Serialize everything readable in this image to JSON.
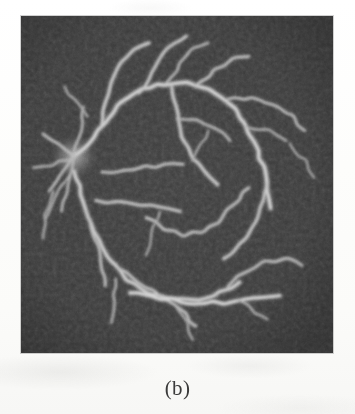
{
  "figure": {
    "caption": "(b)",
    "panel_label": "b",
    "image_kind": "retinal-vessel-segmentation",
    "background_color": "#3b3b3b",
    "vessel_color": "#c8c8c8",
    "page_color": "#fdfdfc",
    "panel": {
      "x": 21,
      "y": 16,
      "width": 312,
      "height": 337
    },
    "chart_data": {
      "type": "image",
      "title": "(b)",
      "description": "Grayscale retinal fundus vessel map: bright vessel tree on dark noisy background",
      "optic_disc": {
        "cx": 0.17,
        "cy": 0.42,
        "r": 0.055
      },
      "vessels": [
        {
          "name": "superior-temporal-arcade",
          "width": 3.2,
          "brightness": 0.82,
          "points": [
            [
              0.17,
              0.42
            ],
            [
              0.23,
              0.36
            ],
            [
              0.28,
              0.3
            ],
            [
              0.33,
              0.25
            ],
            [
              0.39,
              0.22
            ],
            [
              0.46,
              0.2
            ],
            [
              0.53,
              0.2
            ],
            [
              0.6,
              0.22
            ],
            [
              0.67,
              0.26
            ],
            [
              0.72,
              0.32
            ],
            [
              0.76,
              0.4
            ],
            [
              0.79,
              0.49
            ],
            [
              0.8,
              0.57
            ]
          ]
        },
        {
          "name": "superior-nasal-branch",
          "width": 2.6,
          "brightness": 0.78,
          "points": [
            [
              0.26,
              0.33
            ],
            [
              0.27,
              0.26
            ],
            [
              0.29,
              0.2
            ],
            [
              0.32,
              0.14
            ],
            [
              0.36,
              0.1
            ],
            [
              0.41,
              0.08
            ]
          ]
        },
        {
          "name": "superior-mid-branch",
          "width": 2.4,
          "brightness": 0.76,
          "points": [
            [
              0.38,
              0.23
            ],
            [
              0.42,
              0.17
            ],
            [
              0.45,
              0.12
            ],
            [
              0.49,
              0.08
            ],
            [
              0.53,
              0.06
            ]
          ]
        },
        {
          "name": "superior-upper-twig",
          "width": 1.8,
          "brightness": 0.7,
          "points": [
            [
              0.47,
              0.2
            ],
            [
              0.51,
              0.14
            ],
            [
              0.55,
              0.1
            ],
            [
              0.6,
              0.08
            ]
          ]
        },
        {
          "name": "superior-temporal-upper",
          "width": 2.2,
          "brightness": 0.74,
          "points": [
            [
              0.56,
              0.21
            ],
            [
              0.62,
              0.16
            ],
            [
              0.68,
              0.13
            ],
            [
              0.73,
              0.12
            ]
          ]
        },
        {
          "name": "temporal-lateral-branch",
          "width": 2.0,
          "brightness": 0.72,
          "points": [
            [
              0.66,
              0.25
            ],
            [
              0.74,
              0.24
            ],
            [
              0.81,
              0.26
            ],
            [
              0.87,
              0.3
            ],
            [
              0.91,
              0.34
            ]
          ]
        },
        {
          "name": "mid-temporal-short",
          "width": 1.7,
          "brightness": 0.66,
          "points": [
            [
              0.72,
              0.33
            ],
            [
              0.79,
              0.34
            ],
            [
              0.85,
              0.37
            ]
          ]
        },
        {
          "name": "central-descending",
          "width": 2.6,
          "brightness": 0.76,
          "points": [
            [
              0.48,
              0.21
            ],
            [
              0.5,
              0.29
            ],
            [
              0.52,
              0.36
            ],
            [
              0.55,
              0.42
            ],
            [
              0.59,
              0.46
            ],
            [
              0.63,
              0.5
            ]
          ]
        },
        {
          "name": "central-upper-hook",
          "width": 1.9,
          "brightness": 0.68,
          "points": [
            [
              0.5,
              0.3
            ],
            [
              0.56,
              0.31
            ],
            [
              0.62,
              0.33
            ],
            [
              0.67,
              0.37
            ]
          ]
        },
        {
          "name": "macular-branch",
          "width": 2.1,
          "brightness": 0.7,
          "points": [
            [
              0.26,
              0.46
            ],
            [
              0.33,
              0.46
            ],
            [
              0.4,
              0.45
            ],
            [
              0.46,
              0.44
            ],
            [
              0.52,
              0.44
            ]
          ]
        },
        {
          "name": "mid-horizontal",
          "width": 2.3,
          "brightness": 0.72,
          "points": [
            [
              0.24,
              0.55
            ],
            [
              0.31,
              0.55
            ],
            [
              0.38,
              0.56
            ],
            [
              0.45,
              0.57
            ],
            [
              0.51,
              0.58
            ]
          ]
        },
        {
          "name": "central-loop",
          "width": 2.2,
          "brightness": 0.71,
          "points": [
            [
              0.4,
              0.6
            ],
            [
              0.46,
              0.63
            ],
            [
              0.52,
              0.65
            ],
            [
              0.58,
              0.64
            ],
            [
              0.63,
              0.61
            ],
            [
              0.68,
              0.56
            ],
            [
              0.73,
              0.51
            ]
          ]
        },
        {
          "name": "temporal-descending",
          "width": 2.5,
          "brightness": 0.75,
          "points": [
            [
              0.79,
              0.5
            ],
            [
              0.77,
              0.57
            ],
            [
              0.74,
              0.63
            ],
            [
              0.7,
              0.68
            ],
            [
              0.65,
              0.72
            ]
          ]
        },
        {
          "name": "inferior-temporal-arcade",
          "width": 3.0,
          "brightness": 0.8,
          "points": [
            [
              0.17,
              0.46
            ],
            [
              0.2,
              0.55
            ],
            [
              0.23,
              0.64
            ],
            [
              0.28,
              0.72
            ],
            [
              0.34,
              0.78
            ],
            [
              0.41,
              0.82
            ],
            [
              0.49,
              0.84
            ],
            [
              0.57,
              0.84
            ],
            [
              0.64,
              0.82
            ],
            [
              0.7,
              0.79
            ]
          ]
        },
        {
          "name": "inferior-nasal-branch",
          "width": 2.2,
          "brightness": 0.72,
          "points": [
            [
              0.21,
              0.58
            ],
            [
              0.24,
              0.66
            ],
            [
              0.26,
              0.73
            ],
            [
              0.27,
              0.8
            ]
          ]
        },
        {
          "name": "inferior-mid-branch",
          "width": 2.3,
          "brightness": 0.73,
          "points": [
            [
              0.31,
              0.75
            ],
            [
              0.38,
              0.79
            ],
            [
              0.45,
              0.83
            ],
            [
              0.51,
              0.87
            ],
            [
              0.56,
              0.92
            ]
          ]
        },
        {
          "name": "inferior-long-horizontal",
          "width": 2.8,
          "brightness": 0.86,
          "points": [
            [
              0.35,
              0.82
            ],
            [
              0.45,
              0.84
            ],
            [
              0.55,
              0.85
            ],
            [
              0.65,
              0.85
            ],
            [
              0.75,
              0.84
            ],
            [
              0.83,
              0.83
            ]
          ]
        },
        {
          "name": "inferior-temporal-upper",
          "width": 2.2,
          "brightness": 0.72,
          "points": [
            [
              0.66,
              0.8
            ],
            [
              0.72,
              0.76
            ],
            [
              0.78,
              0.73
            ],
            [
              0.85,
              0.72
            ],
            [
              0.9,
              0.74
            ]
          ]
        },
        {
          "name": "inferior-temporal-twig",
          "width": 1.8,
          "brightness": 0.66,
          "points": [
            [
              0.7,
              0.84
            ],
            [
              0.75,
              0.88
            ],
            [
              0.79,
              0.9
            ]
          ]
        },
        {
          "name": "inferior-lower-twig",
          "width": 1.7,
          "brightness": 0.64,
          "points": [
            [
              0.5,
              0.86
            ],
            [
              0.53,
              0.91
            ],
            [
              0.55,
              0.96
            ]
          ]
        },
        {
          "name": "inferior-left-twig",
          "width": 1.8,
          "brightness": 0.65,
          "points": [
            [
              0.3,
              0.78
            ],
            [
              0.3,
              0.85
            ],
            [
              0.29,
              0.91
            ]
          ]
        },
        {
          "name": "disc-radial-1",
          "width": 2.0,
          "brightness": 0.74,
          "points": [
            [
              0.17,
              0.42
            ],
            [
              0.12,
              0.38
            ],
            [
              0.07,
              0.35
            ]
          ]
        },
        {
          "name": "disc-radial-2",
          "width": 1.9,
          "brightness": 0.72,
          "points": [
            [
              0.17,
              0.42
            ],
            [
              0.13,
              0.47
            ],
            [
              0.09,
              0.52
            ]
          ]
        },
        {
          "name": "disc-radial-3",
          "width": 1.8,
          "brightness": 0.7,
          "points": [
            [
              0.17,
              0.42
            ],
            [
              0.15,
              0.5
            ],
            [
              0.13,
              0.58
            ]
          ]
        },
        {
          "name": "disc-radial-4",
          "width": 1.8,
          "brightness": 0.7,
          "points": [
            [
              0.17,
              0.42
            ],
            [
              0.19,
              0.34
            ],
            [
              0.2,
              0.27
            ]
          ]
        },
        {
          "name": "disc-radial-5",
          "width": 1.7,
          "brightness": 0.68,
          "points": [
            [
              0.17,
              0.42
            ],
            [
              0.1,
              0.44
            ],
            [
              0.04,
              0.45
            ]
          ]
        },
        {
          "name": "disc-radial-6",
          "width": 1.6,
          "brightness": 0.66,
          "points": [
            [
              0.16,
              0.46
            ],
            [
              0.11,
              0.53
            ],
            [
              0.08,
              0.6
            ]
          ]
        },
        {
          "name": "nasal-lower-twig",
          "width": 1.6,
          "brightness": 0.64,
          "points": [
            [
              0.1,
              0.52
            ],
            [
              0.08,
              0.59
            ],
            [
              0.07,
              0.66
            ]
          ]
        },
        {
          "name": "superior-left-twig",
          "width": 1.6,
          "brightness": 0.64,
          "points": [
            [
              0.21,
              0.3
            ],
            [
              0.17,
              0.25
            ],
            [
              0.14,
              0.21
            ]
          ]
        },
        {
          "name": "temporal-far-twig",
          "width": 1.5,
          "brightness": 0.62,
          "points": [
            [
              0.86,
              0.38
            ],
            [
              0.91,
              0.43
            ],
            [
              0.94,
              0.48
            ]
          ]
        },
        {
          "name": "central-small-twig",
          "width": 1.5,
          "brightness": 0.6,
          "points": [
            [
              0.55,
              0.43
            ],
            [
              0.58,
              0.38
            ],
            [
              0.6,
              0.34
            ]
          ]
        },
        {
          "name": "mid-lower-twig",
          "width": 1.5,
          "brightness": 0.6,
          "points": [
            [
              0.44,
              0.58
            ],
            [
              0.42,
              0.65
            ],
            [
              0.4,
              0.71
            ]
          ]
        }
      ]
    }
  }
}
